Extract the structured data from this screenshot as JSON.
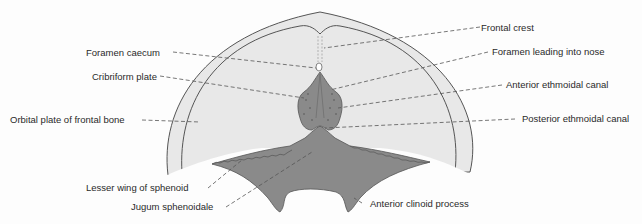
{
  "diagram": {
    "colors": {
      "background": "#fdfdfd",
      "fossa_fill": "#e8e8e8",
      "bone_fill": "#8a8a8a",
      "outline": "#555555",
      "leader": "#555555",
      "text": "#2a2a2a"
    },
    "labels": {
      "frontal_crest": "Frontal crest",
      "foramen_caecum": "Foramen caecum",
      "foramen_nose": "Foramen leading into nose",
      "cribriform_plate": "Cribriform plate",
      "anterior_ethmoidal": "Anterior ethmoidal canal",
      "orbital_plate": "Orbital plate of frontal bone",
      "posterior_ethmoidal": "Posterior ethmoidal canal",
      "lesser_wing": "Lesser wing of sphenoid",
      "jugum": "Jugum sphenoidale",
      "anterior_clinoid": "Anterior clinoid process"
    }
  }
}
